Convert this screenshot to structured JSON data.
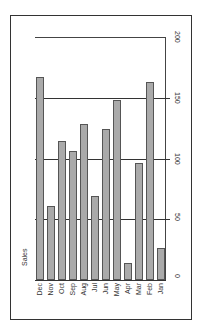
{
  "chart_data": {
    "type": "bar",
    "orientation": "rotated-90",
    "title": "",
    "xlabel": "",
    "ylabel": "Sales",
    "categories": [
      "Dec",
      "Nov",
      "Oct",
      "Sep",
      "Aug",
      "Jul",
      "Jun",
      "May",
      "Apr",
      "Mar",
      "Feb",
      "Jan"
    ],
    "values": [
      167,
      61,
      114,
      106,
      128,
      69,
      124,
      148,
      14,
      96,
      163,
      26
    ],
    "ylim": [
      0,
      200
    ],
    "yticks": [
      0,
      50,
      100,
      150,
      200
    ],
    "grid": true,
    "legend": null,
    "bar_color": "#aaaaaa",
    "edge_color": "#555555"
  }
}
